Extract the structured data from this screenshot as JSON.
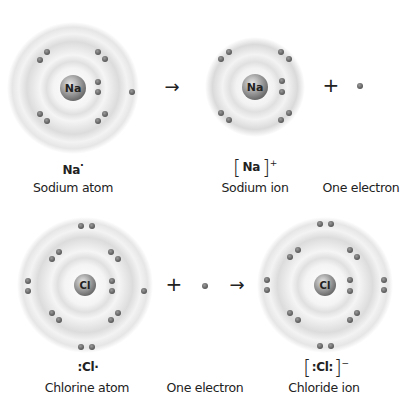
{
  "diagram": {
    "colors": {
      "electron": "#6b6b6b",
      "nucleus": "#8a8a8a",
      "shell_glow": "#d9d9d9",
      "text": "#222222"
    },
    "top_row": {
      "sodium_atom": {
        "symbol": "Na",
        "lewis": "Na",
        "lewis_dot": "·",
        "label": "Sodium atom",
        "shells": [
          2,
          8,
          1
        ]
      },
      "arrow": "→",
      "sodium_ion": {
        "symbol": "Na",
        "formula_open": "[",
        "formula_symbol": "Na",
        "formula_close": "]",
        "charge": "+",
        "label": "Sodium ion",
        "shells": [
          2,
          8
        ]
      },
      "plus": "+",
      "electron": {
        "label": "One electron"
      }
    },
    "bottom_row": {
      "chlorine_atom": {
        "symbol": "Cl",
        "lewis": ":Cl·",
        "label": "Chlorine atom",
        "shells": [
          2,
          8,
          7
        ]
      },
      "plus": "+",
      "electron": {
        "label": "One electron"
      },
      "arrow": "→",
      "chloride_ion": {
        "symbol": "Cl",
        "formula_open": "[",
        "formula_symbol": ":Cl:",
        "formula_close": "]",
        "charge": "−",
        "label": "Chloride ion",
        "shells": [
          2,
          8,
          8
        ]
      }
    }
  }
}
